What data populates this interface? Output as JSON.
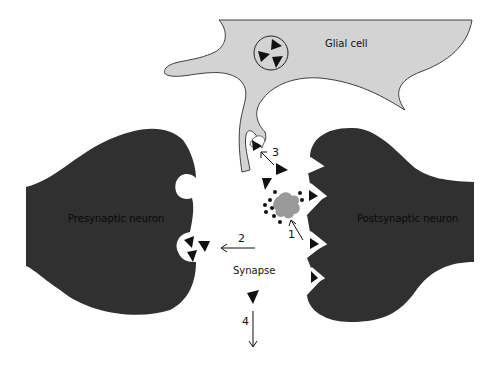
{
  "diagram": {
    "colors": {
      "neuron": "#303030",
      "glia": "#d3d3d3",
      "glia_outline": "#404040",
      "enzyme": "#9a9a9a",
      "background": "#ffffff",
      "ink": "#111111"
    },
    "labels": {
      "glial_cell": "Glial cell",
      "presynaptic": "Presynaptic neuron",
      "postsynaptic": "Postsynaptic neuron",
      "synapse": "Synapse"
    },
    "steps": [
      {
        "number": "1",
        "meaning": "enzymatic degradation"
      },
      {
        "number": "2",
        "meaning": "reuptake into presynaptic neuron"
      },
      {
        "number": "3",
        "meaning": "uptake by glial cell"
      },
      {
        "number": "4",
        "meaning": "diffusion away from synapse"
      }
    ]
  }
}
